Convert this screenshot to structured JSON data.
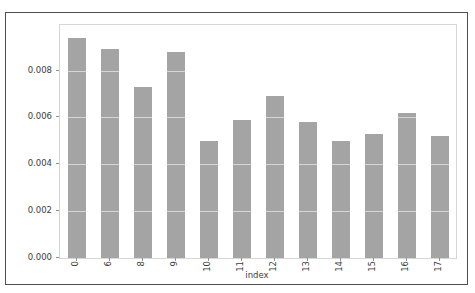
{
  "chart_data": {
    "type": "bar",
    "title": "",
    "xlabel": "index",
    "ylabel": "",
    "categories": [
      "0",
      "6",
      "8",
      "9",
      "10",
      "11",
      "12",
      "13",
      "14",
      "15",
      "16",
      "17"
    ],
    "values": [
      0.0094,
      0.0089,
      0.0073,
      0.0088,
      0.005,
      0.0059,
      0.0069,
      0.0058,
      0.005,
      0.0053,
      0.0062,
      0.0052
    ],
    "ylim": [
      0,
      0.00994
    ],
    "yticks": [
      0.0,
      0.002,
      0.004,
      0.006,
      0.008
    ],
    "ytick_labels": [
      "0.000",
      "0.002",
      "0.004",
      "0.006",
      "0.008"
    ],
    "xtick_label_rotation": 90,
    "grid": true,
    "legend_visible": false,
    "colors": {
      "bar": "#a4a4a4",
      "gridline": "#ffffff",
      "plot_frame": "#d6d6d6",
      "figure_border": "#4f4f4f",
      "tick_text": "#3d3d3d",
      "background": "#ffffff"
    }
  }
}
